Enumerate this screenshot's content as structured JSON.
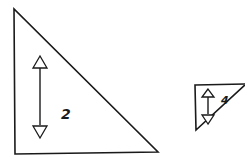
{
  "figure": {
    "stroke_color": "#1a1a1a",
    "background_color": "#ffffff",
    "triangles": [
      {
        "id": "large-triangle",
        "orientation": "right angle at bottom-left",
        "height_label": "2"
      },
      {
        "id": "small-triangle",
        "orientation": "right angle at top-left (inverted)",
        "height_label": "4"
      }
    ]
  }
}
